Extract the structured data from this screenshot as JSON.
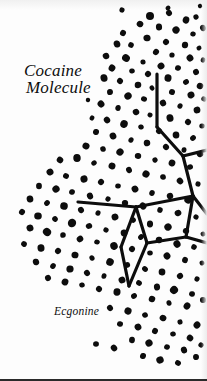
{
  "figure": {
    "type": "illustration",
    "background_color": "#fdfdfd",
    "ink_color": "#0d0d0d",
    "title_line_1": "Cocaine",
    "title_line_2": "Molecule",
    "caption": "Ecgonine",
    "bottom_rule_color": "#2a2a2a"
  },
  "diagram": {
    "bond_color": "#0d0d0d",
    "bond_width": 3.2,
    "bonds": [
      {
        "name": "n-methyl-stem",
        "x1": 157,
        "y1": 74,
        "x2": 157,
        "y2": 127
      },
      {
        "name": "stem-to-bridge",
        "x1": 157,
        "y1": 127,
        "x2": 183,
        "y2": 156
      },
      {
        "name": "bridge-to-right-edge",
        "x1": 183,
        "y1": 156,
        "x2": 207,
        "y2": 150
      },
      {
        "name": "ring-right-upper",
        "x1": 183,
        "y1": 156,
        "x2": 193,
        "y2": 196
      },
      {
        "name": "ring-right-lower",
        "x1": 193,
        "y1": 196,
        "x2": 207,
        "y2": 214
      },
      {
        "name": "pentagon-top",
        "x1": 136,
        "y1": 207,
        "x2": 193,
        "y2": 196
      },
      {
        "name": "pentagon-right",
        "x1": 193,
        "y1": 196,
        "x2": 186,
        "y2": 237
      },
      {
        "name": "pentagon-bottom",
        "x1": 186,
        "y1": 237,
        "x2": 207,
        "y2": 243
      },
      {
        "name": "pentagon-left-lower",
        "x1": 136,
        "y1": 207,
        "x2": 147,
        "y2": 243
      },
      {
        "name": "pentagon-inner-right",
        "x1": 147,
        "y1": 243,
        "x2": 186,
        "y2": 237
      },
      {
        "name": "bridgehead-left-arm",
        "x1": 136,
        "y1": 207,
        "x2": 78,
        "y2": 202
      },
      {
        "name": "bridge-down-left",
        "x1": 136,
        "y1": 207,
        "x2": 121,
        "y2": 247
      },
      {
        "name": "bridge-apex-left",
        "x1": 121,
        "y1": 247,
        "x2": 129,
        "y2": 286
      },
      {
        "name": "bridge-apex-right",
        "x1": 129,
        "y1": 286,
        "x2": 147,
        "y2": 243
      }
    ]
  },
  "stipple": {
    "description": "hand-drawn stipple dot field forming a diagonal cloud",
    "color": "#0d0d0d",
    "dots": [
      [
        150,
        16,
        4.0
      ],
      [
        169,
        13,
        3.0
      ],
      [
        186,
        20,
        3.4
      ],
      [
        196,
        17,
        2.6
      ],
      [
        140,
        24,
        3.2
      ],
      [
        159,
        27,
        3.2
      ],
      [
        176,
        30,
        3.6
      ],
      [
        193,
        34,
        2.6
      ],
      [
        203,
        28,
        3.0
      ],
      [
        123,
        33,
        3.0
      ],
      [
        147,
        38,
        3.4
      ],
      [
        166,
        42,
        3.0
      ],
      [
        185,
        45,
        3.2
      ],
      [
        199,
        48,
        2.4
      ],
      [
        131,
        45,
        2.8
      ],
      [
        117,
        44,
        3.4
      ],
      [
        156,
        52,
        3.0
      ],
      [
        172,
        55,
        2.6
      ],
      [
        190,
        58,
        3.4
      ],
      [
        203,
        60,
        2.4
      ],
      [
        106,
        56,
        3.2
      ],
      [
        126,
        58,
        3.8
      ],
      [
        143,
        62,
        2.6
      ],
      [
        161,
        66,
        3.4
      ],
      [
        178,
        68,
        2.8
      ],
      [
        196,
        72,
        3.0
      ],
      [
        112,
        68,
        3.4
      ],
      [
        132,
        71,
        2.6
      ],
      [
        148,
        74,
        3.0
      ],
      [
        168,
        78,
        3.6
      ],
      [
        186,
        82,
        2.8
      ],
      [
        200,
        86,
        3.2
      ],
      [
        104,
        78,
        3.6
      ],
      [
        120,
        81,
        3.0
      ],
      [
        138,
        85,
        3.2
      ],
      [
        152,
        88,
        2.4
      ],
      [
        172,
        92,
        3.0
      ],
      [
        191,
        95,
        3.4
      ],
      [
        204,
        99,
        2.6
      ],
      [
        110,
        92,
        3.0
      ],
      [
        128,
        96,
        3.6
      ],
      [
        144,
        99,
        2.8
      ],
      [
        163,
        103,
        3.2
      ],
      [
        180,
        106,
        2.6
      ],
      [
        197,
        110,
        3.4
      ],
      [
        101,
        104,
        3.4
      ],
      [
        118,
        108,
        2.8
      ],
      [
        136,
        112,
        3.2
      ],
      [
        150,
        115,
        2.4
      ],
      [
        170,
        118,
        3.6
      ],
      [
        188,
        122,
        3.0
      ],
      [
        202,
        126,
        2.6
      ],
      [
        107,
        120,
        3.2
      ],
      [
        124,
        124,
        3.8
      ],
      [
        141,
        127,
        2.6
      ],
      [
        159,
        131,
        3.0
      ],
      [
        176,
        135,
        3.4
      ],
      [
        193,
        138,
        2.8
      ],
      [
        96,
        132,
        3.0
      ],
      [
        113,
        136,
        3.4
      ],
      [
        131,
        140,
        2.6
      ],
      [
        147,
        143,
        3.2
      ],
      [
        166,
        147,
        3.0
      ],
      [
        184,
        150,
        2.6
      ],
      [
        200,
        154,
        3.2
      ],
      [
        86,
        146,
        3.4
      ],
      [
        103,
        149,
        2.8
      ],
      [
        120,
        152,
        3.6
      ],
      [
        138,
        156,
        3.0
      ],
      [
        155,
        160,
        2.6
      ],
      [
        172,
        163,
        3.4
      ],
      [
        190,
        167,
        2.8
      ],
      [
        60,
        160,
        3.2
      ],
      [
        77,
        158,
        3.8
      ],
      [
        94,
        163,
        2.6
      ],
      [
        112,
        166,
        3.4
      ],
      [
        129,
        170,
        3.0
      ],
      [
        146,
        174,
        3.6
      ],
      [
        163,
        177,
        2.8
      ],
      [
        180,
        181,
        3.2
      ],
      [
        198,
        184,
        2.6
      ],
      [
        50,
        172,
        3.4
      ],
      [
        66,
        176,
        2.8
      ],
      [
        84,
        179,
        3.6
      ],
      [
        101,
        182,
        3.0
      ],
      [
        118,
        186,
        2.6
      ],
      [
        135,
        189,
        3.4
      ],
      [
        152,
        193,
        2.8
      ],
      [
        170,
        196,
        3.2
      ],
      [
        188,
        200,
        3.6
      ],
      [
        39,
        186,
        3.0
      ],
      [
        56,
        189,
        3.6
      ],
      [
        72,
        192,
        2.8
      ],
      [
        90,
        196,
        3.2
      ],
      [
        108,
        199,
        2.6
      ],
      [
        125,
        203,
        3.0
      ],
      [
        143,
        206,
        3.4
      ],
      [
        160,
        210,
        2.8
      ],
      [
        178,
        213,
        3.2
      ],
      [
        196,
        217,
        2.6
      ],
      [
        30,
        199,
        3.4
      ],
      [
        47,
        203,
        2.8
      ],
      [
        64,
        206,
        3.8
      ],
      [
        81,
        210,
        3.0
      ],
      [
        98,
        213,
        2.6
      ],
      [
        115,
        217,
        3.4
      ],
      [
        133,
        220,
        2.8
      ],
      [
        150,
        224,
        3.2
      ],
      [
        168,
        227,
        3.6
      ],
      [
        186,
        231,
        3.0
      ],
      [
        203,
        234,
        2.4
      ],
      [
        22,
        212,
        3.0
      ],
      [
        38,
        216,
        3.6
      ],
      [
        55,
        219,
        2.8
      ],
      [
        72,
        223,
        4.2
      ],
      [
        89,
        226,
        3.0
      ],
      [
        106,
        230,
        2.6
      ],
      [
        124,
        233,
        3.4
      ],
      [
        141,
        237,
        2.8
      ],
      [
        159,
        240,
        3.2
      ],
      [
        177,
        244,
        3.6
      ],
      [
        194,
        247,
        2.8
      ],
      [
        30,
        228,
        3.4
      ],
      [
        47,
        232,
        4.0
      ],
      [
        63,
        235,
        2.8
      ],
      [
        80,
        239,
        3.2
      ],
      [
        97,
        242,
        2.6
      ],
      [
        114,
        246,
        3.8
      ],
      [
        132,
        249,
        3.0
      ],
      [
        150,
        253,
        2.6
      ],
      [
        167,
        256,
        3.4
      ],
      [
        185,
        260,
        3.0
      ],
      [
        202,
        263,
        2.4
      ],
      [
        24,
        244,
        2.8
      ],
      [
        41,
        248,
        3.6
      ],
      [
        58,
        251,
        3.0
      ],
      [
        75,
        255,
        3.4
      ],
      [
        92,
        258,
        2.6
      ],
      [
        110,
        262,
        3.8
      ],
      [
        127,
        265,
        3.0
      ],
      [
        145,
        269,
        2.8
      ],
      [
        162,
        272,
        3.4
      ],
      [
        180,
        276,
        3.0
      ],
      [
        197,
        279,
        2.6
      ],
      [
        36,
        262,
        3.2
      ],
      [
        53,
        266,
        2.8
      ],
      [
        70,
        269,
        3.6
      ],
      [
        87,
        273,
        3.0
      ],
      [
        104,
        276,
        2.6
      ],
      [
        122,
        280,
        3.4
      ],
      [
        139,
        283,
        2.8
      ],
      [
        157,
        287,
        3.2
      ],
      [
        174,
        290,
        4.0
      ],
      [
        192,
        294,
        2.8
      ],
      [
        48,
        278,
        3.0
      ],
      [
        65,
        282,
        3.4
      ],
      [
        82,
        285,
        2.6
      ],
      [
        99,
        289,
        3.0
      ],
      [
        117,
        292,
        3.6
      ],
      [
        134,
        296,
        2.8
      ],
      [
        152,
        299,
        3.2
      ],
      [
        169,
        303,
        2.6
      ],
      [
        187,
        306,
        3.4
      ],
      [
        203,
        300,
        3.0
      ],
      [
        110,
        308,
        3.0
      ],
      [
        128,
        311,
        3.6
      ],
      [
        145,
        315,
        2.8
      ],
      [
        163,
        318,
        3.2
      ],
      [
        180,
        322,
        2.6
      ],
      [
        197,
        325,
        3.4
      ],
      [
        120,
        324,
        2.8
      ],
      [
        138,
        327,
        3.4
      ],
      [
        155,
        331,
        3.0
      ],
      [
        173,
        334,
        2.6
      ],
      [
        190,
        338,
        3.2
      ],
      [
        132,
        340,
        3.0
      ],
      [
        149,
        343,
        3.6
      ],
      [
        167,
        347,
        2.8
      ],
      [
        184,
        350,
        3.2
      ],
      [
        201,
        345,
        2.6
      ],
      [
        96,
        344,
        2.8
      ],
      [
        114,
        348,
        3.2
      ],
      [
        143,
        356,
        3.0
      ],
      [
        160,
        360,
        3.6
      ],
      [
        178,
        363,
        2.8
      ],
      [
        196,
        357,
        3.0
      ],
      [
        168,
        8,
        2.4
      ],
      [
        122,
        10,
        2.6
      ],
      [
        200,
        6,
        2.2
      ],
      [
        92,
        118,
        2.4
      ],
      [
        88,
        100,
        2.2
      ]
    ]
  }
}
